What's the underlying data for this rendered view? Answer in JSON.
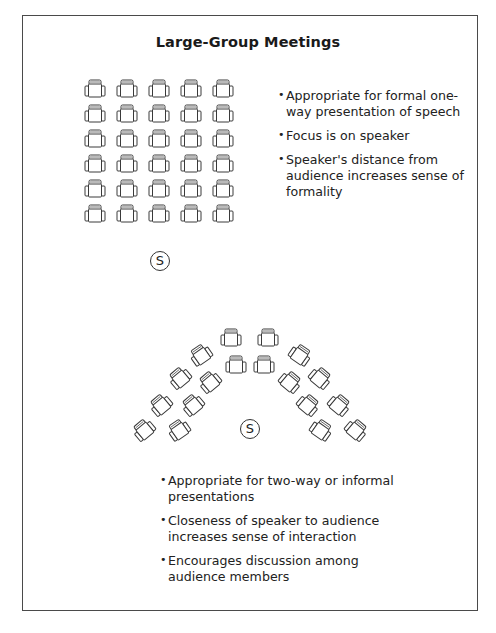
{
  "title": "Large-Group Meetings",
  "colors": {
    "line": "#3a3a3a",
    "text": "#1e1e1e",
    "background": "#ffffff"
  },
  "layout1": {
    "name": "classroom-rows",
    "rows": 6,
    "cols": 5,
    "speaker_label": "S",
    "bullets": [
      "Appropriate for formal one-way presentation of speech",
      "Focus is on speaker",
      "Speaker's distance from audience increases sense of formality"
    ]
  },
  "layout2": {
    "name": "semicircle",
    "speaker_label": "S",
    "bullets": [
      "Appropriate for two-way or informal presentations",
      "Closeness of speaker to audience increases sense of interaction",
      "Encourages discussion among audience members"
    ]
  }
}
